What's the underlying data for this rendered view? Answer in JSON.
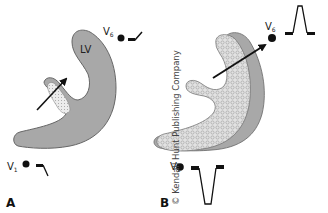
{
  "figure": {
    "panels": [
      {
        "id": "A",
        "label": "A",
        "chamber_label": "LV",
        "leads": [
          {
            "name": "V",
            "sub": "6",
            "waveform": "small-upward-deflection"
          },
          {
            "name": "V",
            "sub": "1",
            "waveform": "small-downward-deflection"
          }
        ],
        "fill_color": "#a8a8a8",
        "hatched_region_color": "#e6e6e6"
      },
      {
        "id": "B",
        "label": "B",
        "leads": [
          {
            "name": "V",
            "sub": "6",
            "waveform": "tall-R-wave"
          },
          {
            "name": "V",
            "sub": "1",
            "waveform": "deep-S-wave"
          }
        ],
        "fill_color": "#dcdcdc",
        "outer_band_color": "#a8a8a8"
      }
    ],
    "copyright": "© Kendall Hunt Publishing Company"
  }
}
